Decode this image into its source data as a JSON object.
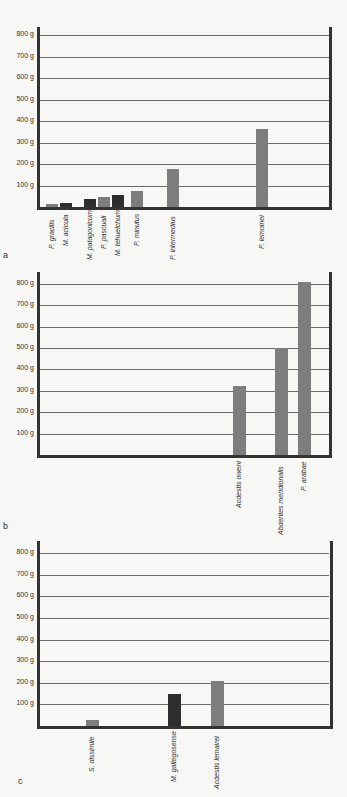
{
  "chart_data": [
    {
      "panel": "a",
      "type": "bar",
      "title": "",
      "xlabel": "",
      "ylabel": "",
      "ylim": [
        0,
        860
      ],
      "yticks": [
        "100 g",
        "200 g",
        "300 g",
        "400 g",
        "500 g",
        "600 g",
        "700 g",
        "800 g"
      ],
      "grid": true,
      "categories": [
        "P. gracilis",
        "M. acicula",
        "M. patagonicum",
        "P. pascuali",
        "M. tehuelchum",
        "P. minutus",
        "P. intermedius",
        "P. lemoinei"
      ],
      "values": [
        15,
        18,
        35,
        45,
        55,
        75,
        175,
        365
      ],
      "colors": [
        "#7d7d7d",
        "#2e2e2e",
        "#2e2e2e",
        "#7d7d7d",
        "#2e2e2e",
        "#7d7d7d",
        "#7d7d7d",
        "#7d7d7d"
      ]
    },
    {
      "panel": "b",
      "type": "bar",
      "title": "",
      "xlabel": "",
      "ylabel": "",
      "ylim": [
        0,
        860
      ],
      "yticks": [
        "100 g",
        "200 g",
        "300 g",
        "400 g",
        "500 g",
        "600 g",
        "700 g",
        "800 g"
      ],
      "grid": true,
      "categories": [
        "Acdestis oweni",
        "Abderites meridionalis",
        "P. arabae"
      ],
      "values": [
        322,
        500,
        810
      ],
      "colors": [
        "#7d7d7d",
        "#7d7d7d",
        "#7d7d7d"
      ]
    },
    {
      "panel": "c",
      "type": "bar",
      "title": "",
      "xlabel": "",
      "ylabel": "",
      "ylim": [
        0,
        860
      ],
      "yticks": [
        "100 g",
        "200 g",
        "300 g",
        "400 g",
        "500 g",
        "600 g",
        "700 g",
        "800 g"
      ],
      "grid": true,
      "categories": [
        "S. dissimile",
        "M. gallegosense",
        "Acdestis lemairei"
      ],
      "values": [
        30,
        150,
        210
      ],
      "colors": [
        "#7d7d7d",
        "#2e2e2e",
        "#7d7d7d"
      ]
    }
  ],
  "panels": [
    {
      "label": "a"
    },
    {
      "label": "b"
    },
    {
      "label": "c"
    }
  ]
}
